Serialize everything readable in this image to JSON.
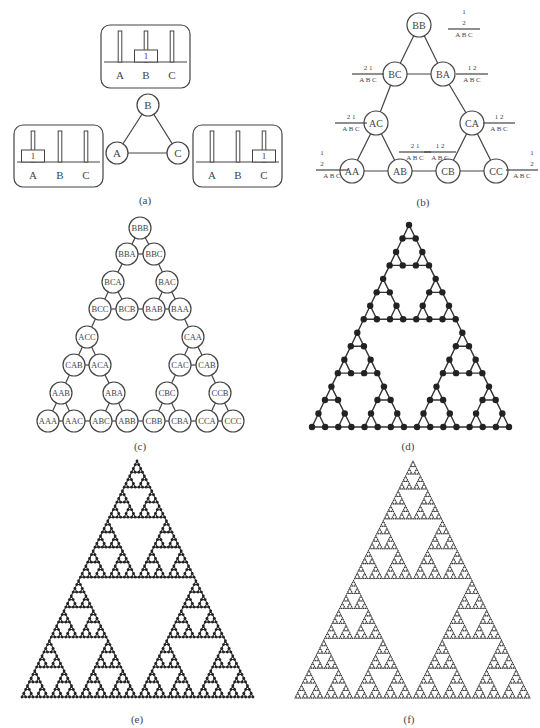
{
  "figure": {
    "panels": {
      "a": {
        "caption": "(a)",
        "caption_pos": [
          145,
          201
        ],
        "graph": {
          "node_radius": 11,
          "nodes": [
            {
              "label": "B",
              "x": 148,
              "y": 105
            },
            {
              "label": "A",
              "x": 117,
              "y": 153
            },
            {
              "label": "C",
              "x": 178,
              "y": 153
            }
          ],
          "edges": [
            [
              0,
              1
            ],
            [
              0,
              2
            ],
            [
              1,
              2
            ]
          ]
        },
        "peg_boxes": [
          {
            "name": "state-B",
            "x": 101,
            "y": 25,
            "w": 89,
            "h": 63,
            "baseline": 62,
            "pegs": [
              120,
              146,
              172
            ],
            "peg_labels": [
              "A",
              "B",
              "C"
            ],
            "disk_on": 1,
            "disk_label": "1"
          },
          {
            "name": "state-A",
            "x": 14,
            "y": 125,
            "w": 89,
            "h": 62,
            "baseline": 162,
            "pegs": [
              33,
              60,
              86
            ],
            "peg_labels": [
              "A",
              "B",
              "C"
            ],
            "disk_on": 0,
            "disk_label": "1"
          },
          {
            "name": "state-C",
            "x": 193,
            "y": 125,
            "w": 89,
            "h": 62,
            "baseline": 162,
            "pegs": [
              212,
              238,
              264
            ],
            "peg_labels": [
              "A",
              "B",
              "C"
            ],
            "disk_on": 2,
            "disk_label": "1"
          }
        ]
      },
      "b": {
        "caption": "(b)",
        "caption_pos": [
          423,
          203
        ],
        "graph": {
          "node_radius": 12,
          "nodes": [
            {
              "label": "BB",
              "x": 419,
              "y": 25
            },
            {
              "label": "BC",
              "x": 395,
              "y": 74
            },
            {
              "label": "BA",
              "x": 443,
              "y": 74
            },
            {
              "label": "AC",
              "x": 376,
              "y": 123
            },
            {
              "label": "CA",
              "x": 472,
              "y": 123
            },
            {
              "label": "AA",
              "x": 352,
              "y": 171
            },
            {
              "label": "AB",
              "x": 400,
              "y": 171
            },
            {
              "label": "CB",
              "x": 448,
              "y": 171
            },
            {
              "label": "CC",
              "x": 496,
              "y": 171
            }
          ],
          "edges": [
            [
              0,
              1
            ],
            [
              0,
              2
            ],
            [
              1,
              2
            ],
            [
              1,
              3
            ],
            [
              2,
              4
            ],
            [
              3,
              5
            ],
            [
              3,
              6
            ],
            [
              5,
              6
            ],
            [
              6,
              7
            ],
            [
              4,
              7
            ],
            [
              4,
              8
            ],
            [
              7,
              8
            ]
          ]
        },
        "peg_annotations": [
          {
            "node": "BB",
            "x": 450,
            "y": 12,
            "stack": [
              "1",
              "2"
            ],
            "positions": [
              "B",
              "B"
            ],
            "pegs": "A B C"
          },
          {
            "node": "BC",
            "x": 354,
            "y": 68,
            "top": "2 1",
            "pegs": "A B C"
          },
          {
            "node": "BA",
            "x": 458,
            "y": 68,
            "top": "1 2",
            "pegs": "A B C"
          },
          {
            "node": "AC",
            "x": 337,
            "y": 117,
            "top": "2   1",
            "pegs": "A B C"
          },
          {
            "node": "CA",
            "x": 485,
            "y": 117,
            "top": "1   2",
            "pegs": "A B C"
          },
          {
            "node": "AB",
            "x": 401,
            "y": 146,
            "top": "2 1",
            "pegs": "A B C"
          },
          {
            "node": "CB",
            "x": 426,
            "y": 146,
            "top": "1 2",
            "pegs": "A B C"
          },
          {
            "node": "AA",
            "x": 318,
            "y": 153,
            "stack": [
              "1",
              "2"
            ],
            "positions": [
              "A",
              "A"
            ],
            "pegs": "A B C"
          },
          {
            "node": "CC",
            "x": 508,
            "y": 153,
            "stack": [
              "1",
              "2"
            ],
            "positions": [
              "C",
              "C"
            ],
            "pegs": "A B C"
          }
        ]
      },
      "c": {
        "caption": "(c)",
        "caption_pos": [
          140,
          447
        ],
        "graph": {
          "node_radius": 11,
          "rows": [
            {
              "y": 228,
              "nodes": [
                {
                  "label": "BBB",
                  "x": 140
                }
              ]
            },
            {
              "y": 254,
              "nodes": [
                {
                  "label": "BBA",
                  "x": 127
                },
                {
                  "label": "BBC",
                  "x": 154
                }
              ]
            },
            {
              "y": 282,
              "nodes": [
                {
                  "label": "BCA",
                  "x": 113
                },
                {
                  "label": "BAC",
                  "x": 167
                }
              ]
            },
            {
              "y": 309,
              "nodes": [
                {
                  "label": "BCC",
                  "x": 100
                },
                {
                  "label": "BCB",
                  "x": 127
                },
                {
                  "label": "BAB",
                  "x": 154
                },
                {
                  "label": "BAA",
                  "x": 180
                }
              ]
            },
            {
              "y": 337,
              "nodes": [
                {
                  "label": "ACC",
                  "x": 87
                },
                {
                  "label": "CAA",
                  "x": 193
                }
              ]
            },
            {
              "y": 365,
              "nodes": [
                {
                  "label": "CAB",
                  "x": 74
                },
                {
                  "label": "ACA",
                  "x": 100
                },
                {
                  "label": "CAC",
                  "x": 180
                },
                {
                  "label": "CAB",
                  "x": 207
                }
              ]
            },
            {
              "y": 393,
              "nodes": [
                {
                  "label": "AAB",
                  "x": 61
                },
                {
                  "label": "ABA",
                  "x": 114
                },
                {
                  "label": "CBC",
                  "x": 167
                },
                {
                  "label": "CCB",
                  "x": 220
                }
              ]
            },
            {
              "y": 421,
              "nodes": [
                {
                  "label": "AAA",
                  "x": 48
                },
                {
                  "label": "AAC",
                  "x": 74
                },
                {
                  "label": "ABC",
                  "x": 101
                },
                {
                  "label": "ABB",
                  "x": 127
                },
                {
                  "label": "CBB",
                  "x": 154
                },
                {
                  "label": "CBA",
                  "x": 180
                },
                {
                  "label": "CCA",
                  "x": 207
                },
                {
                  "label": "CCC",
                  "x": 233
                }
              ]
            }
          ]
        }
      },
      "d": {
        "caption": "(d)",
        "caption_pos": [
          408,
          447
        ],
        "fractal": {
          "level": 4,
          "apex": [
            409,
            225
          ],
          "left": [
            312,
            427
          ],
          "right": [
            509,
            427
          ],
          "dot_radius": 3.2,
          "stroke_width": 1.4
        }
      },
      "e": {
        "caption": "(e)",
        "caption_pos": [
          137,
          720
        ],
        "fractal": {
          "level": 6,
          "apex": [
            137,
            461
          ],
          "left": [
            22,
            697
          ],
          "right": [
            253,
            697
          ],
          "dot_radius": 1.4,
          "stroke_width": 1.1
        }
      },
      "f": {
        "caption": "(f)",
        "caption_pos": [
          409,
          720
        ],
        "fractal": {
          "level": 7,
          "apex": [
            413,
            461
          ],
          "left": [
            295,
            698
          ],
          "right": [
            530,
            698
          ],
          "dot_radius": 0.55,
          "stroke_width": 0.5
        }
      }
    }
  }
}
